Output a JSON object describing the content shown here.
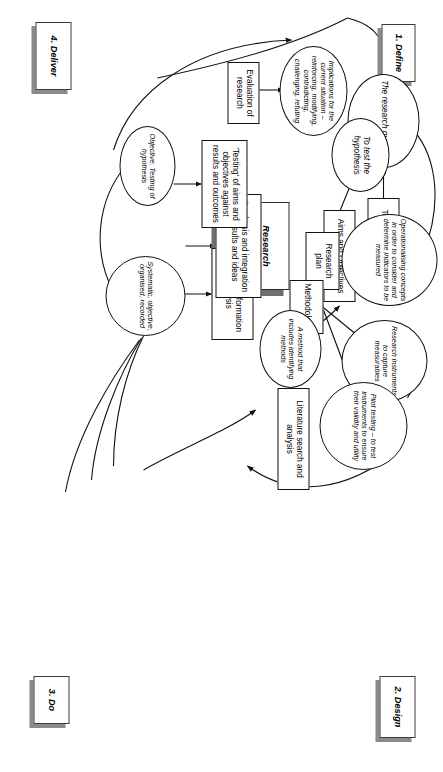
{
  "diagram": {
    "title": "Research project life cycle",
    "center_title_lines": [
      "Research",
      "project life",
      "cycle"
    ],
    "phases": [
      {
        "id": "define",
        "label": "1. Define"
      },
      {
        "id": "design",
        "label": "2. Design"
      },
      {
        "id": "do",
        "label": "3. Do"
      },
      {
        "id": "deliver",
        "label": "4. Deliver"
      }
    ],
    "nodes": [
      {
        "id": "topic",
        "shape": "box",
        "label": "Topic"
      },
      {
        "id": "research-question",
        "shape": "ellipse",
        "label": "The research question"
      },
      {
        "id": "aims-objectives",
        "shape": "box",
        "label": "Aims and Objectives"
      },
      {
        "id": "test-hypothesis",
        "shape": "ellipse",
        "label": "To test the hypothesis"
      },
      {
        "id": "operationalising",
        "shape": "ellipse",
        "label": "Operationalising concepts in order to consider and determine indicators to be measured"
      },
      {
        "id": "research-plan",
        "shape": "box",
        "label": "Research plan"
      },
      {
        "id": "research-instruments",
        "shape": "ellipse",
        "label": "Research instruments to capture measurables"
      },
      {
        "id": "methodology",
        "shape": "box",
        "label": "Methodology"
      },
      {
        "id": "pilot-testing",
        "shape": "ellipse",
        "label": "Pilot testing – to test instruments to ensure their validity and utility"
      },
      {
        "id": "method-identifying",
        "shape": "ellipse",
        "label": "A method that includes identifying methods"
      },
      {
        "id": "literature-search",
        "shape": "box",
        "label": "Literature search and analysis"
      },
      {
        "id": "systematic",
        "shape": "circle",
        "label": "Systematic, objective, organised, recorded"
      },
      {
        "id": "data-analysis",
        "shape": "box",
        "label": "Data and information analysis"
      },
      {
        "id": "synthesis",
        "shape": "box",
        "label": "Synthesis and integration of results and ideas"
      },
      {
        "id": "testing-aims",
        "shape": "box",
        "label": "'Testing' of aims and objectives against results and outcomes"
      },
      {
        "id": "objective-testing",
        "shape": "ellipse",
        "label": "Objective: Testing of hypothesis"
      },
      {
        "id": "implications",
        "shape": "ellipse",
        "label": "Implications for the current situation – reinforcing, modifying, contradicting, challenging, refuting"
      },
      {
        "id": "evaluation",
        "shape": "box",
        "label": "Evaluation of research"
      }
    ],
    "edges": [
      {
        "from": "topic",
        "to": "research-question"
      },
      {
        "from": "research-question",
        "to": "operationalising"
      },
      {
        "from": "aims-objectives",
        "to": "test-hypothesis"
      },
      {
        "from": "research-plan",
        "to": "operationalising"
      },
      {
        "from": "methodology",
        "to": "research-instruments"
      },
      {
        "from": "methodology",
        "to": "pilot-testing"
      },
      {
        "from": "pilot-testing",
        "to": "research-instruments"
      },
      {
        "from": "literature-search",
        "to": "method-identifying"
      },
      {
        "from": "method-identifying",
        "to": "methodology"
      },
      {
        "from": "systematic",
        "to": "data-analysis"
      },
      {
        "from": "systematic",
        "to": "synthesis"
      },
      {
        "from": "objective-testing",
        "to": "testing-aims"
      },
      {
        "from": "evaluation",
        "to": "implications"
      },
      {
        "from": "design-arc",
        "to": "literature-search"
      },
      {
        "from": "do-arc",
        "to": "objective-testing"
      },
      {
        "from": "deliver-arc",
        "to": "define-arc"
      }
    ],
    "colors": {
      "stroke": "#111111",
      "shadow": "#8a8a8a",
      "background": "#ffffff"
    }
  }
}
